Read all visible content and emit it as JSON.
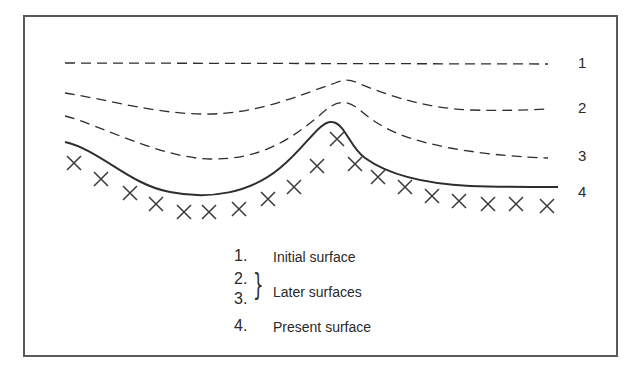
{
  "diagram": {
    "colors": {
      "line": "#2e2e2e",
      "frame": "#5a5a5a",
      "background": "#ffffff"
    },
    "surfaces": [
      {
        "id": "1",
        "label": "1",
        "style": "dashed",
        "description": "flat horizontal line"
      },
      {
        "id": "2",
        "label": "2",
        "style": "dashed",
        "description": "gentle dip with peak near center"
      },
      {
        "id": "3",
        "label": "3",
        "style": "dashed",
        "description": "deeper dip with sharper peak"
      },
      {
        "id": "4",
        "label": "4",
        "style": "solid",
        "description": "present surface, deepest dip with sharp peak"
      }
    ],
    "substrate_marker": "x",
    "legend": {
      "items": [
        {
          "num": "1.",
          "text": "Initial surface"
        },
        {
          "num": "2.",
          "text": ""
        },
        {
          "num": "3.",
          "text": ""
        },
        {
          "num": "4.",
          "text": "Present surface"
        }
      ],
      "group_label": "Later surfaces",
      "brace": "}"
    }
  }
}
